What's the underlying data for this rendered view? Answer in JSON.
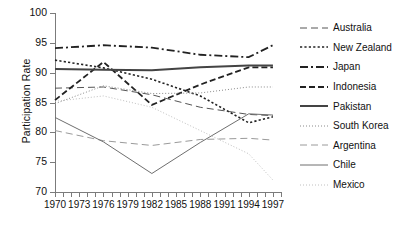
{
  "axes": {
    "ylabel": "Participation Rate",
    "yticks": [
      70,
      75,
      80,
      85,
      90,
      95,
      100
    ],
    "ylim": [
      70,
      100
    ],
    "xlabel": "",
    "xlim": [
      1970,
      1998
    ],
    "xticklabels": [
      "1970",
      "1973",
      "1976",
      "1979",
      "1982",
      "1985",
      "1988",
      "1991",
      "1994",
      "1997"
    ],
    "xtickvalues": [
      1970,
      1973,
      1976,
      1979,
      1982,
      1985,
      1988,
      1991,
      1994,
      1997
    ],
    "minor_tick_step": 1,
    "grid": false
  },
  "legend": {
    "position": "right",
    "entries": [
      {
        "label": "Australia",
        "dash": "long-dash",
        "width": 1.0,
        "color": "#555555"
      },
      {
        "label": "New Zealand",
        "dash": "dotted-sq",
        "width": 1.6,
        "color": "#222222"
      },
      {
        "label": "Japan",
        "dash": "dash-dot",
        "width": 1.8,
        "color": "#222222"
      },
      {
        "label": "Indonesia",
        "dash": "dashed",
        "width": 1.8,
        "color": "#222222"
      },
      {
        "label": "Pakistan",
        "dash": "solid",
        "width": 2.0,
        "color": "#444444"
      },
      {
        "label": "South Korea",
        "dash": "fine-dot",
        "width": 1.0,
        "color": "#8a8a8a"
      },
      {
        "label": "Argentina",
        "dash": "long-dash",
        "width": 1.0,
        "color": "#9a9a9a"
      },
      {
        "label": "Chile",
        "dash": "solid",
        "width": 1.0,
        "color": "#6e6e6e"
      },
      {
        "label": "Mexico",
        "dash": "fine-dot",
        "width": 1.0,
        "color": "#c0c0c0"
      }
    ]
  },
  "chart_data": {
    "type": "line",
    "title": "",
    "xlabel": "",
    "ylabel": "Participation Rate",
    "xlim": [
      1970,
      1998
    ],
    "ylim": [
      70,
      100
    ],
    "x": [
      1970,
      1976,
      1982,
      1988,
      1994,
      1997
    ],
    "series": [
      {
        "name": "Australia",
        "values": [
          87.4,
          87.6,
          86.3,
          84.2,
          83.0,
          82.8
        ]
      },
      {
        "name": "New Zealand",
        "values": [
          92.1,
          90.8,
          88.9,
          86.1,
          81.6,
          82.6
        ]
      },
      {
        "name": "Japan",
        "values": [
          94.1,
          94.6,
          94.2,
          93.0,
          92.6,
          94.6
        ]
      },
      {
        "name": "Indonesia",
        "values": [
          85.4,
          91.8,
          84.6,
          88.0,
          90.9,
          90.9
        ]
      },
      {
        "name": "Pakistan",
        "values": [
          90.6,
          90.5,
          90.4,
          90.9,
          91.2,
          91.2
        ]
      },
      {
        "name": "South Korea",
        "values": [
          84.8,
          87.8,
          86.5,
          86.6,
          87.6,
          87.6
        ]
      },
      {
        "name": "Argentina",
        "values": [
          80.3,
          78.6,
          77.8,
          78.8,
          79.0,
          78.7
        ]
      },
      {
        "name": "Chile",
        "values": [
          82.5,
          78.4,
          73.1,
          78.3,
          83.1,
          82.9
        ]
      },
      {
        "name": "Mexico",
        "values": [
          85.2,
          86.1,
          84.2,
          80.3,
          76.4,
          72.0
        ]
      }
    ]
  }
}
